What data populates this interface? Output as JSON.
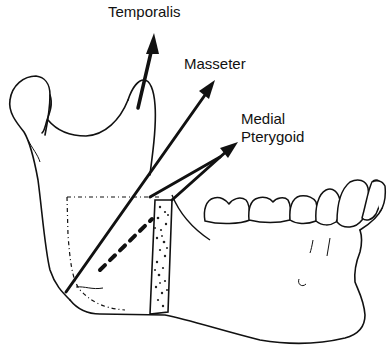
{
  "figure": {
    "labels": {
      "temporalis": "Temporalis",
      "masseter": "Masseter",
      "medial_pterygoid_line1": "Medial",
      "medial_pterygoid_line2": "Pterygoid"
    },
    "arrows": [
      {
        "name": "temporalis-arrow",
        "label_ref": "temporalis"
      },
      {
        "name": "masseter-arrow",
        "label_ref": "masseter"
      },
      {
        "name": "medial-pterygoid-arrow",
        "label_ref": "medial_pterygoid"
      }
    ],
    "colors": {
      "ink": "#111111",
      "background": "#ffffff"
    }
  }
}
